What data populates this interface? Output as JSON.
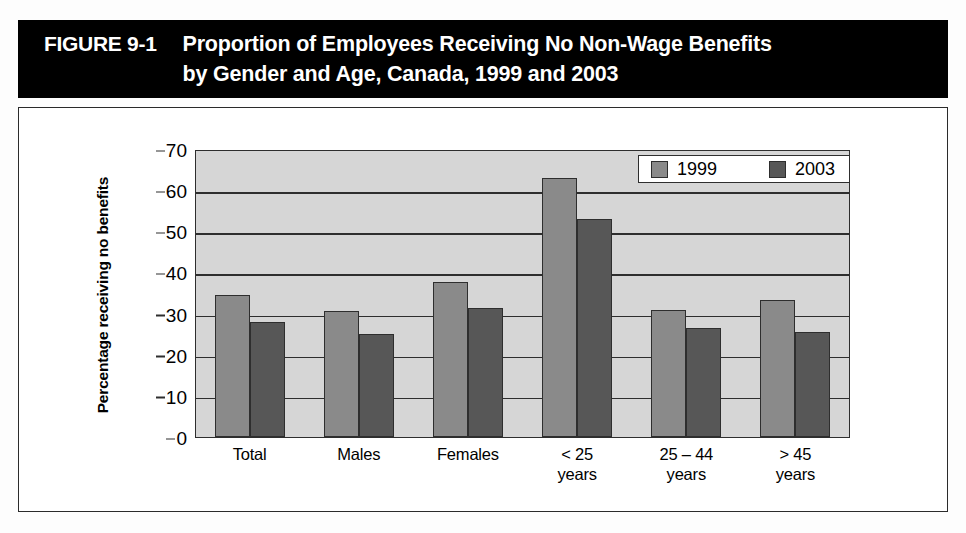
{
  "figure": {
    "label": "FIGURE 9-1",
    "title_line1": "Proportion of Employees Receiving No Non-Wage Benefits",
    "title_line2": "by Gender and Age, Canada, 1999 and 2003"
  },
  "legend": {
    "items": [
      {
        "label": "1999",
        "color": "#8a8a8a"
      },
      {
        "label": "2003",
        "color": "#575757"
      }
    ]
  },
  "axes": {
    "y_title": "Percentage receiving no benefits",
    "y_ticks": [
      "70",
      "60",
      "50",
      "40",
      "30",
      "20",
      "10",
      "0"
    ],
    "x_labels": [
      {
        "line1": "Total",
        "line2": ""
      },
      {
        "line1": "Males",
        "line2": ""
      },
      {
        "line1": "Females",
        "line2": ""
      },
      {
        "line1": "< 25",
        "line2": "years"
      },
      {
        "line1": "25 – 44",
        "line2": "years"
      },
      {
        "line1": "> 45",
        "line2": "years"
      }
    ]
  },
  "chart_data": {
    "type": "bar",
    "title": "Proportion of Employees Receiving No Non-Wage Benefits by Gender and Age, Canada, 1999 and 2003",
    "xlabel": "",
    "ylabel": "Percentage receiving no benefits",
    "ylim": [
      0,
      70
    ],
    "ytick_step": 10,
    "grid": true,
    "legend_position": "top-right",
    "categories": [
      "Total",
      "Males",
      "Females",
      "< 25 years",
      "25 – 44 years",
      "> 45 years"
    ],
    "series": [
      {
        "name": "1999",
        "color": "#8a8a8a",
        "values": [
          34.5,
          30.7,
          37.7,
          63.0,
          30.8,
          33.3
        ]
      },
      {
        "name": "2003",
        "color": "#575757",
        "values": [
          28.0,
          25.0,
          31.3,
          53.0,
          26.5,
          25.5
        ]
      }
    ]
  }
}
